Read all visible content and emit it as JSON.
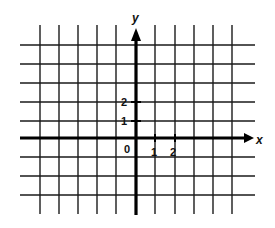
{
  "diagram": {
    "type": "coordinate-plane",
    "axes": {
      "x_label": "x",
      "y_label": "y",
      "origin_label": "0"
    },
    "x_ticks": [
      {
        "value": 1,
        "label": "1"
      },
      {
        "value": 2,
        "label": "2"
      }
    ],
    "y_ticks": [
      {
        "value": 1,
        "label": "1"
      },
      {
        "value": 2,
        "label": "2"
      }
    ],
    "grid": {
      "x_range": [
        -5,
        5
      ],
      "y_range": [
        -3,
        5
      ],
      "line_color": "#1a1a1a",
      "axis_color": "#000000"
    }
  }
}
